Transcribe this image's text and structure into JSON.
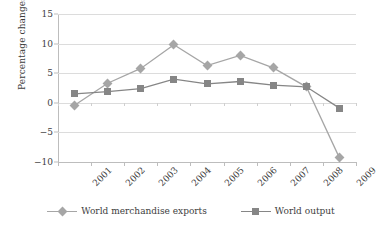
{
  "chart_data": {
    "type": "line",
    "title": "",
    "xlabel": "",
    "ylabel": "Percentage changes",
    "categories": [
      "2001",
      "2002",
      "2003",
      "2004",
      "2005",
      "2006",
      "2007",
      "2008",
      "2009"
    ],
    "yticks": [
      15,
      10,
      5,
      0,
      -5,
      -10
    ],
    "ylim": [
      -10,
      15
    ],
    "grid": true,
    "legend_position": "bottom",
    "series": [
      {
        "name": "World merchandise exports",
        "marker": "diamond",
        "color": "#a6a6a6",
        "values": [
          -0.4,
          3.3,
          5.8,
          9.8,
          6.3,
          8.0,
          5.9,
          2.7,
          -9.3
        ]
      },
      {
        "name": "World output",
        "marker": "square",
        "color": "#868686",
        "values": [
          1.5,
          1.9,
          2.4,
          4.0,
          3.2,
          3.6,
          3.0,
          2.7,
          -0.9
        ]
      }
    ]
  },
  "colors": {
    "axis": "#bdbdbd",
    "grid": "#dcdcdc",
    "text": "#3d3d3d",
    "background": "#ffffff"
  }
}
